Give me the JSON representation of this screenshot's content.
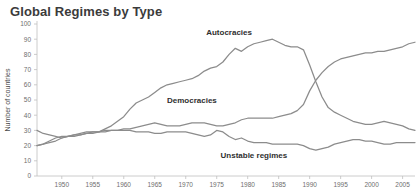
{
  "title": "Global Regimes by Type",
  "chart_data": {
    "type": "line",
    "title": "Global Regimes by Type",
    "xlabel": "",
    "ylabel": "Number of countries",
    "xlim": [
      1946,
      2007
    ],
    "ylim": [
      0,
      100
    ],
    "grid": false,
    "legend_position": "inline-annotations",
    "line_color": "#8c8c8c",
    "xticks": [
      1950,
      1955,
      1960,
      1965,
      1970,
      1975,
      1980,
      1985,
      1990,
      1995,
      2000,
      2005
    ],
    "yticks": [
      0,
      10,
      20,
      30,
      40,
      50,
      60,
      70,
      80,
      90,
      100
    ],
    "x": [
      1946,
      1947,
      1948,
      1949,
      1950,
      1951,
      1952,
      1953,
      1954,
      1955,
      1956,
      1957,
      1958,
      1959,
      1960,
      1961,
      1962,
      1963,
      1964,
      1965,
      1966,
      1967,
      1968,
      1969,
      1970,
      1971,
      1972,
      1973,
      1974,
      1975,
      1976,
      1977,
      1978,
      1979,
      1980,
      1981,
      1982,
      1983,
      1984,
      1985,
      1986,
      1987,
      1988,
      1989,
      1990,
      1991,
      1992,
      1993,
      1994,
      1995,
      1996,
      1997,
      1998,
      1999,
      2000,
      2001,
      2002,
      2003,
      2004,
      2005,
      2006,
      2007
    ],
    "series": [
      {
        "name": "Autocracies",
        "label": "Autocracies",
        "color": "#8c8c8c",
        "label_x": 1977,
        "label_y": 93,
        "values": [
          20,
          21,
          22,
          23,
          25,
          26,
          27,
          27,
          28,
          28,
          29,
          31,
          33,
          36,
          39,
          44,
          48,
          50,
          52,
          55,
          58,
          60,
          61,
          62,
          63,
          64,
          66,
          69,
          71,
          72,
          75,
          80,
          84,
          82,
          85,
          87,
          88,
          89,
          90,
          88,
          86,
          85,
          85,
          83,
          73,
          62,
          52,
          45,
          42,
          40,
          38,
          36,
          35,
          34,
          34,
          35,
          36,
          35,
          34,
          33,
          31,
          30
        ]
      },
      {
        "name": "Democracies",
        "label": "Democracies",
        "color": "#8c8c8c",
        "label_x": 1971,
        "label_y": 48,
        "values": [
          30,
          28,
          27,
          26,
          25,
          26,
          27,
          28,
          29,
          29,
          29,
          30,
          30,
          30,
          31,
          31,
          32,
          33,
          34,
          35,
          34,
          33,
          33,
          33,
          34,
          35,
          35,
          35,
          34,
          33,
          33,
          34,
          35,
          37,
          38,
          38,
          38,
          38,
          38,
          39,
          40,
          41,
          43,
          47,
          56,
          63,
          68,
          72,
          75,
          77,
          78,
          79,
          80,
          81,
          81,
          82,
          82,
          83,
          84,
          85,
          87,
          88
        ]
      },
      {
        "name": "Unstable regimes",
        "label": "Unstable regimes",
        "color": "#8c8c8c",
        "label_x": 1981,
        "label_y": 12,
        "values": [
          20,
          21,
          23,
          25,
          26,
          26,
          26,
          27,
          28,
          29,
          29,
          29,
          30,
          30,
          30,
          30,
          29,
          29,
          29,
          28,
          28,
          29,
          29,
          29,
          29,
          28,
          27,
          26,
          27,
          30,
          29,
          26,
          24,
          25,
          23,
          22,
          22,
          22,
          21,
          21,
          21,
          21,
          21,
          20,
          18,
          17,
          18,
          19,
          21,
          22,
          23,
          24,
          24,
          23,
          23,
          22,
          21,
          21,
          22,
          22,
          22,
          22
        ]
      }
    ]
  }
}
